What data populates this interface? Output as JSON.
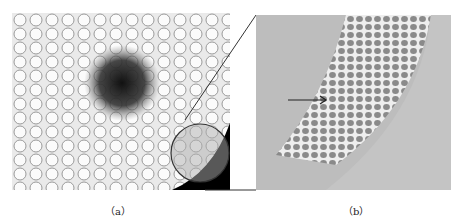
{
  "figure": {
    "panels": [
      {
        "id": "a",
        "caption": "（a）",
        "description": "Micrograph of stem cross-section with dark central region and circled zoom area"
      },
      {
        "id": "b",
        "caption": "（b）",
        "description": "Magnified view of circled region showing honeycomb cell layer with arrow"
      }
    ]
  }
}
